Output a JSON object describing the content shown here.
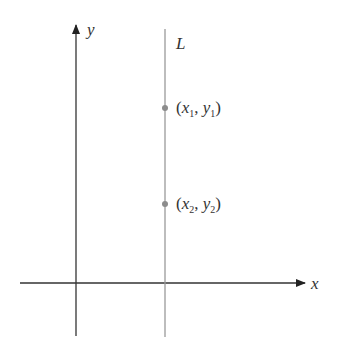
{
  "axes": {
    "x_label": "x",
    "y_label": "y"
  },
  "line": {
    "label": "L",
    "type": "vertical"
  },
  "points": [
    {
      "label_open": "(",
      "x": "x",
      "x_sub": "1",
      "sep": ", ",
      "y": "y",
      "y_sub": "1",
      "label_close": ")"
    },
    {
      "label_open": "(",
      "x": "x",
      "x_sub": "2",
      "sep": ", ",
      "y": "y",
      "y_sub": "2",
      "label_close": ")"
    }
  ],
  "colors": {
    "axis": "#333333",
    "line": "#9a9a9a",
    "point": "#8c8c8c"
  }
}
